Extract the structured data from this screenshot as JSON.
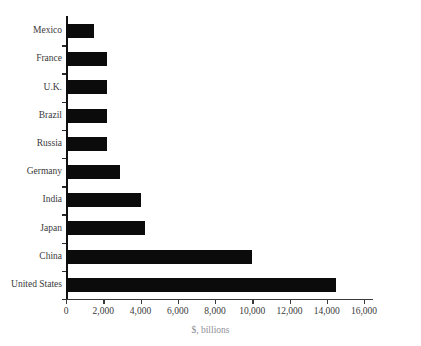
{
  "chart_data": {
    "type": "bar",
    "orientation": "horizontal",
    "title": "",
    "xlabel": "$, billions",
    "ylabel": "",
    "xlim": [
      0,
      16000
    ],
    "xticks": [
      0,
      2000,
      4000,
      6000,
      8000,
      10000,
      12000,
      14000,
      16000
    ],
    "xtick_labels": [
      "0",
      "2,000",
      "4,000",
      "6,000",
      "8,000",
      "10,000",
      "12,000",
      "14,000",
      "16,000"
    ],
    "grid": false,
    "legend": null,
    "categories": [
      "Mexico",
      "France",
      "U.K.",
      "Brazil",
      "Russia",
      "Germany",
      "India",
      "Japan",
      "China",
      "United States"
    ],
    "values": [
      1500,
      2200,
      2200,
      2200,
      2200,
      2900,
      4000,
      4250,
      10000,
      14500
    ],
    "bar_color": "#0b0b0b",
    "axis_color": "#222222"
  },
  "figure": {
    "title_fragment": "",
    "axis_title": "$, billions"
  }
}
